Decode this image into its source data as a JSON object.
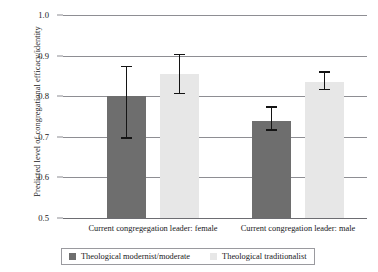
{
  "chart_data": {
    "type": "bar",
    "title": "",
    "xlabel": "",
    "ylabel": "Predicted level of congregational efficacy/identity",
    "ylim": [
      0.5,
      1.0
    ],
    "ytick_labels": [
      "1.0",
      "0.9",
      "0.8",
      "0.7",
      "0.6",
      "0.5"
    ],
    "ytick_values": [
      1.0,
      0.9,
      0.8,
      0.7,
      0.6,
      0.5
    ],
    "grid": true,
    "legend_position": "below-axis",
    "categories": [
      "Current congregegation leader: female",
      "Current congregation leader: male"
    ],
    "series": [
      {
        "name": "Theological modernist/moderate",
        "color": "#6e6e6e",
        "values": [
          0.8,
          0.74
        ],
        "error_low": [
          0.695,
          0.715
        ],
        "error_high": [
          0.875,
          0.775
        ]
      },
      {
        "name": "Theological traditionalist",
        "color": "#e7e7e7",
        "values": [
          0.855,
          0.835
        ],
        "error_low": [
          0.805,
          0.815
        ],
        "error_high": [
          0.905,
          0.862
        ]
      }
    ]
  },
  "axis": {
    "y_title": "Predicted level of congregational efficacy/identity",
    "ticks": [
      {
        "label": "1.0",
        "value": 1.0
      },
      {
        "label": "0.9",
        "value": 0.9
      },
      {
        "label": "0.8",
        "value": 0.8
      },
      {
        "label": "0.7",
        "value": 0.7
      },
      {
        "label": "0.6",
        "value": 0.6
      },
      {
        "label": "0.5",
        "value": 0.5
      }
    ]
  },
  "groups": [
    {
      "label": "Current congregegation leader: female"
    },
    {
      "label": "Current congregation leader: male"
    }
  ],
  "legend": {
    "entries": [
      {
        "label": "Theological modernist/moderate",
        "color": "#6e6e6e"
      },
      {
        "label": "Theological traditionalist",
        "color": "#e7e7e7"
      }
    ]
  }
}
